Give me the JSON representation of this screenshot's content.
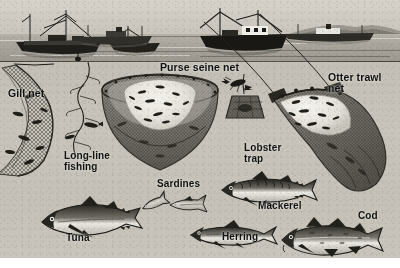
{
  "figure": {
    "kind": "illustration",
    "style": "black-and-white halftone engraving",
    "scene": {
      "above_water": "harbour with trawlers, seiners and a freighter on the horizon",
      "below_water": "cutaway showing five fishing gear types and four food fishes"
    }
  },
  "palette": {
    "sky": "#d7d3cb",
    "sea": "#a9a59c",
    "underwater": "#c6c2b9",
    "ink": "#1b1a17",
    "net": "#6e6a62",
    "label_text": "#111111",
    "paper": "#ffffff"
  },
  "labels": [
    {
      "id": "gill-net",
      "text": "Gill net",
      "x": 8,
      "y": 88,
      "size": "l-big"
    },
    {
      "id": "purse-seine-net",
      "text": "Purse seine net",
      "x": 160,
      "y": 62,
      "size": "l-big"
    },
    {
      "id": "otter-trawl-net",
      "text": "Otter trawl\nnet",
      "x": 328,
      "y": 72,
      "size": "l-big"
    },
    {
      "id": "long-line-fishing",
      "text": "Long-line\nfishing",
      "x": 64,
      "y": 151,
      "size": "l-mid"
    },
    {
      "id": "lobster-trap",
      "text": "Lobster\ntrap",
      "x": 244,
      "y": 143,
      "size": "l-mid"
    },
    {
      "id": "sardines",
      "text": "Sardines",
      "x": 157,
      "y": 179,
      "size": "l-mid"
    },
    {
      "id": "mackerel",
      "text": "Mackerel",
      "x": 258,
      "y": 201,
      "size": "l-mid"
    },
    {
      "id": "cod",
      "text": "Cod",
      "x": 358,
      "y": 211,
      "size": "l-mid"
    },
    {
      "id": "tuna",
      "text": "Tuna",
      "x": 66,
      "y": 233,
      "size": "l-mid"
    },
    {
      "id": "herring",
      "text": "Herring",
      "x": 222,
      "y": 232,
      "size": "l-mid"
    }
  ],
  "gear": [
    {
      "id": "gill-net",
      "name": "Gill net",
      "description": "curtain of netting hanging vertically, fish meshed in it"
    },
    {
      "id": "long-line",
      "name": "Long-line fishing",
      "description": "mainline with many baited branch hooks"
    },
    {
      "id": "purse-seine",
      "name": "Purse seine net",
      "description": "large bowl of net encircling a school of fish"
    },
    {
      "id": "lobster-trap",
      "name": "Lobster trap",
      "description": "baited pot on a line with a lobster above"
    },
    {
      "id": "otter-trawl",
      "name": "Otter trawl net",
      "description": "towed cone-shaped bag net full of fish"
    }
  ],
  "fishes": [
    {
      "id": "tuna",
      "name": "Tuna"
    },
    {
      "id": "sardines",
      "name": "Sardines"
    },
    {
      "id": "herring",
      "name": "Herring"
    },
    {
      "id": "mackerel",
      "name": "Mackerel"
    },
    {
      "id": "cod",
      "name": "Cod"
    }
  ],
  "vessels": [
    {
      "id": "trawler-left",
      "description": "dark-hulled trawler with mast and boom"
    },
    {
      "id": "trawler-mid",
      "description": "small fishing boat"
    },
    {
      "id": "coaster",
      "description": "coaster with funnel amidships"
    },
    {
      "id": "seiner-right",
      "description": "seiner with wheelhouse and derrick"
    },
    {
      "id": "freighter-horizon",
      "description": "freighter against distant headland"
    }
  ]
}
